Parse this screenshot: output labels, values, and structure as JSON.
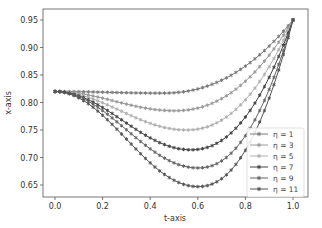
{
  "chart_data": {
    "type": "line",
    "title": "",
    "xlabel": "t-axis",
    "ylabel": "x-axis",
    "xlim": [
      -0.05,
      1.05
    ],
    "ylim": [
      0.63,
      0.96
    ],
    "xticks": [
      0.0,
      0.2,
      0.4,
      0.6,
      0.8,
      1.0
    ],
    "xtick_labels": [
      "0.0",
      "0.2",
      "0.4",
      "0.6",
      "0.8",
      "1.0"
    ],
    "yticks": [
      0.65,
      0.7,
      0.75,
      0.8,
      0.85,
      0.9,
      0.95
    ],
    "ytick_labels": [
      "0.65",
      "0.70",
      "0.75",
      "0.80",
      "0.85",
      "0.90",
      "0.95"
    ],
    "grid": false,
    "legend_position": "lower right",
    "marker": "star",
    "start_value": 0.82,
    "end_value": 0.95,
    "series": [
      {
        "name": "η = 1",
        "eta": 1,
        "color": "#7a7a7a",
        "min_value": 0.817,
        "min_t": 0.45
      },
      {
        "name": "η = 3",
        "eta": 3,
        "color": "#9a9a9a",
        "min_value": 0.785,
        "min_t": 0.5
      },
      {
        "name": "η = 5",
        "eta": 5,
        "color": "#b0b0b0",
        "min_value": 0.75,
        "min_t": 0.55
      },
      {
        "name": "η = 7",
        "eta": 7,
        "color": "#444444",
        "min_value": 0.714,
        "min_t": 0.57
      },
      {
        "name": "η = 9",
        "eta": 9,
        "color": "#666666",
        "min_value": 0.681,
        "min_t": 0.6
      },
      {
        "name": "η = 11",
        "eta": 11,
        "color": "#555555",
        "min_value": 0.647,
        "min_t": 0.6
      }
    ]
  }
}
